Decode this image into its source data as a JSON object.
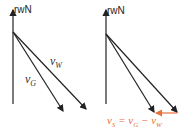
{
  "left": {
    "axis_label": "rwN",
    "vw_label": "v",
    "vw_sub": "W",
    "vg_label": "v",
    "vg_sub": "G"
  },
  "right": {
    "axis_label": "rwN",
    "formula": {
      "lhs": "v",
      "lhs_sub": "S",
      "eq": " = ",
      "a": "v",
      "a_sub": "G",
      "op": " − ",
      "b": "v",
      "b_sub": "W"
    }
  },
  "colors": {
    "line": "#222222",
    "accent": "#e8703a"
  }
}
